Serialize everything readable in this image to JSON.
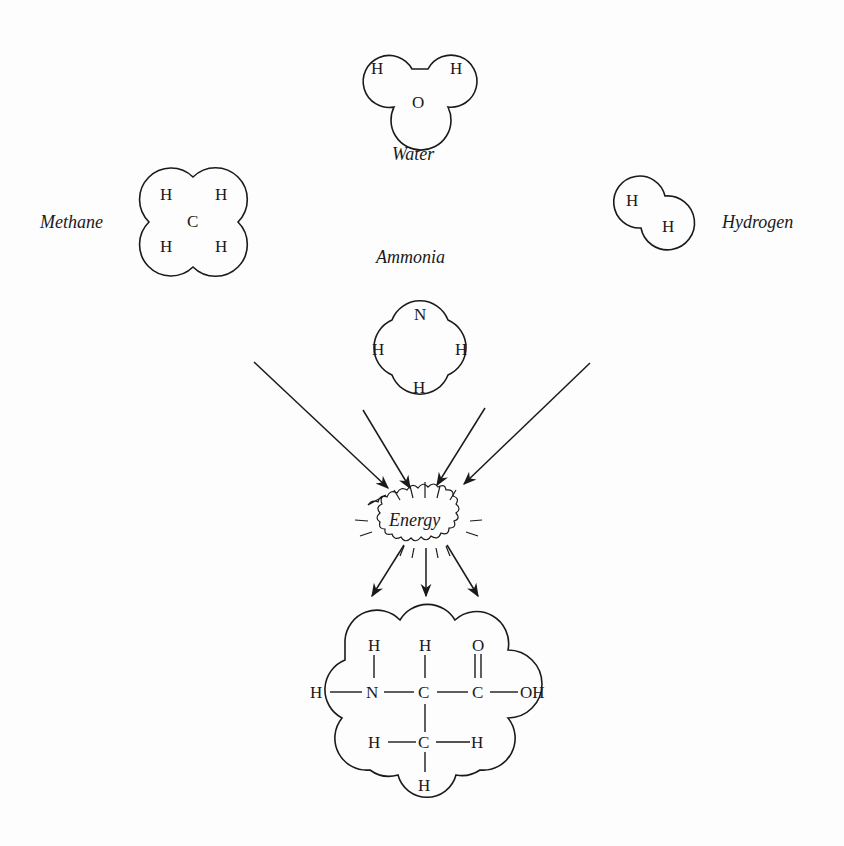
{
  "molecules": {
    "water": {
      "label": "Water",
      "atoms": [
        "H",
        "H",
        "O"
      ]
    },
    "methane": {
      "label": "Methane",
      "atoms": [
        "H",
        "H",
        "C",
        "H",
        "H"
      ]
    },
    "hydrogen": {
      "label": "Hydrogen",
      "atoms": [
        "H",
        "H"
      ]
    },
    "ammonia": {
      "label": "Ammonia",
      "atoms": [
        "N",
        "H",
        "H",
        "H"
      ]
    }
  },
  "energy": {
    "label": "Energy"
  },
  "product": {
    "atoms": {
      "h_top_n": "H",
      "h_top_c": "H",
      "o_top": "O",
      "h_left": "H",
      "n": "N",
      "c_alpha": "C",
      "c_carboxyl": "C",
      "oh": "OH",
      "h_methyl_left": "H",
      "c_methyl": "C",
      "h_methyl_right": "H",
      "h_methyl_bottom": "H"
    }
  },
  "colors": {
    "ink": "#1a1a1a",
    "background": "#fdfdfd"
  }
}
